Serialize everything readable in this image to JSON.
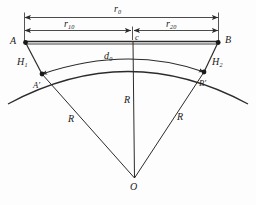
{
  "figure": {
    "type": "geometry-diagram"
  },
  "labels": {
    "point_a": "A",
    "point_b": "B",
    "point_a_prime": "A′",
    "point_b_prime": "B′",
    "point_o": "O",
    "offset_h1_base": "H",
    "offset_h1_sub": "1",
    "offset_h2_base": "H",
    "offset_h2_sub": "2",
    "arc_d0_base": "d",
    "arc_d0_sub": "0",
    "centre_c": "c",
    "radius_left": "R",
    "radius_centre": "R",
    "radius_right": "R"
  },
  "dimensions": {
    "r0_base": "r",
    "r0_sub": "0",
    "r10_base": "r",
    "r10_sub": "10",
    "r20_base": "r",
    "r20_sub": "20"
  },
  "colors": {
    "ink": "#1a1a1a",
    "line": "#2b2b2b",
    "background": "#fdfdfd"
  }
}
